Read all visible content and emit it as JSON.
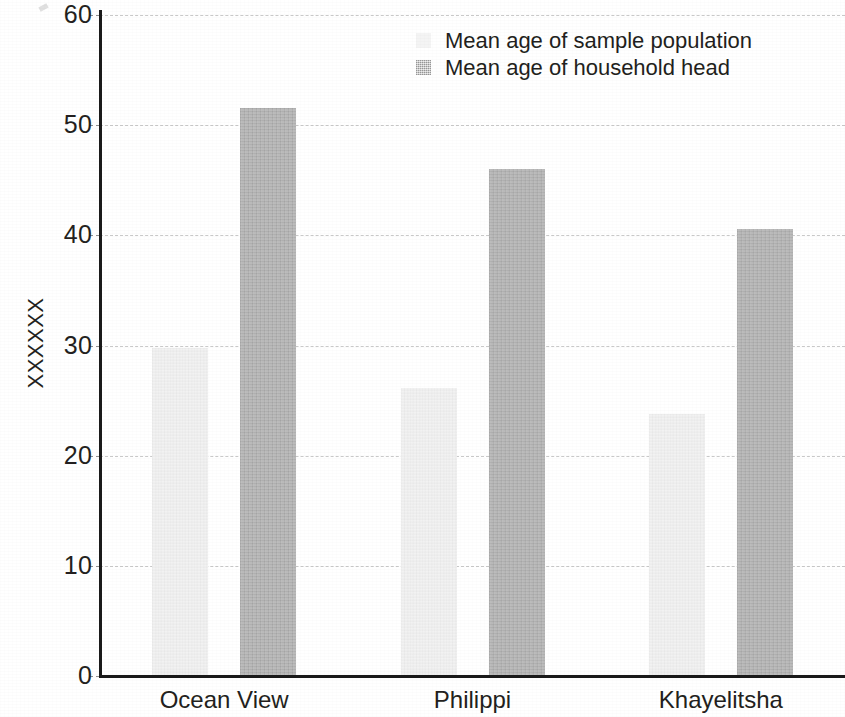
{
  "chart_data": {
    "type": "bar",
    "title": "",
    "subtitle": "",
    "xlabel": "",
    "ylabel": "XXXXXX",
    "categories": [
      "Ocean View",
      "Philippi",
      "Khayelitsha"
    ],
    "series": [
      {
        "name": "Mean age of sample population",
        "color": "#f2f2f2",
        "values": [
          29.8,
          26.1,
          23.8
        ]
      },
      {
        "name": "Mean age of household head",
        "color": "#b9b9b9",
        "values": [
          51.6,
          46.0,
          40.6
        ]
      }
    ],
    "ylim": [
      0,
      60
    ],
    "yticks": [
      0,
      10,
      20,
      30,
      40,
      50,
      60
    ],
    "ytick_labels": [
      "0",
      "10",
      "20",
      "30",
      "40",
      "50",
      "60"
    ],
    "grid": true,
    "grid_axis": "y",
    "legend_position": "top-center"
  },
  "legend": {
    "entries": [
      {
        "label": "Mean age of sample population",
        "swatch": "sample"
      },
      {
        "label": "Mean age of household head",
        "swatch": "head"
      }
    ]
  }
}
